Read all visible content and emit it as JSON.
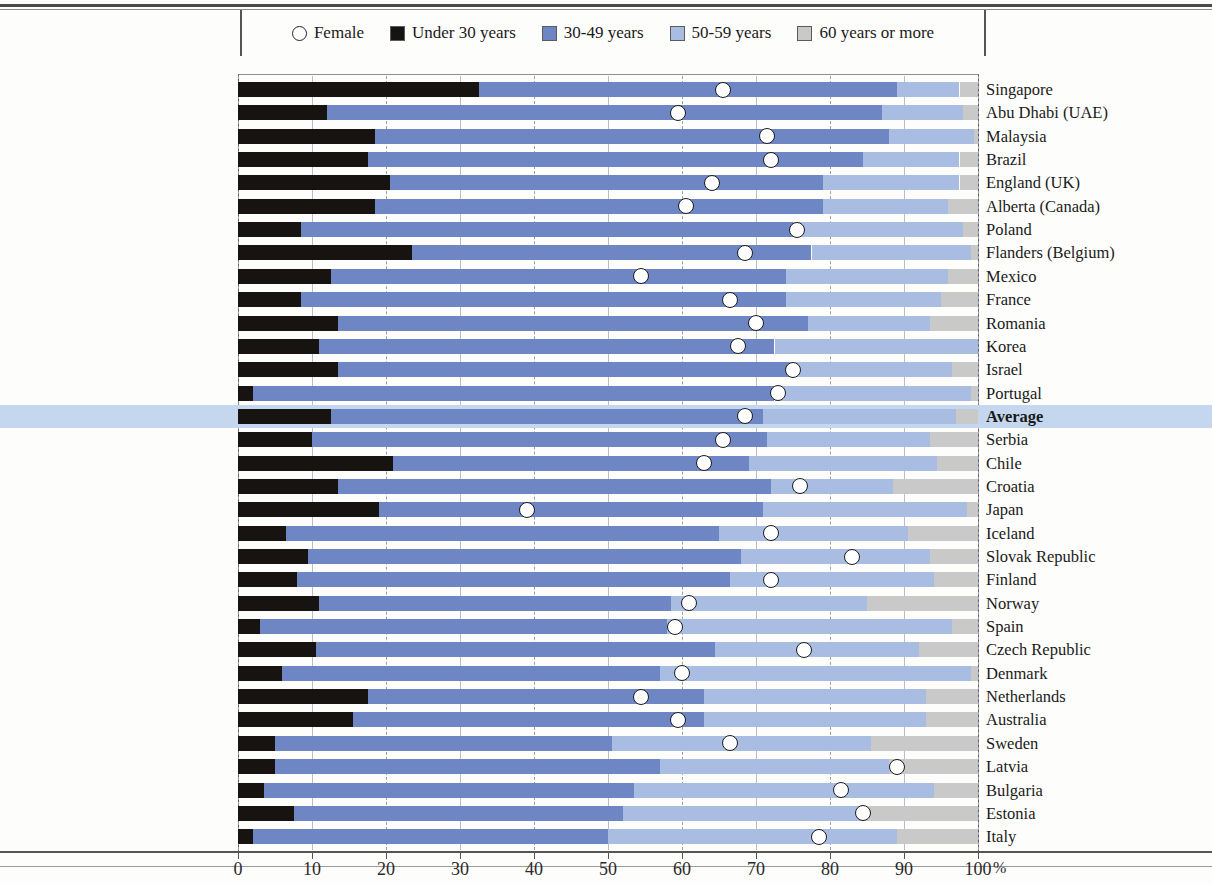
{
  "legend": {
    "items": [
      {
        "label": "Female",
        "type": "circle",
        "color": "#ffffff"
      },
      {
        "label": "Under 30 years",
        "type": "swatch",
        "color": "#171310"
      },
      {
        "label": "30-49 years",
        "type": "swatch",
        "color": "#6e87c4"
      },
      {
        "label": "50-59 years",
        "type": "swatch",
        "color": "#a9bde2"
      },
      {
        "label": "60 years or more",
        "type": "swatch",
        "color": "#c9c9c9"
      }
    ]
  },
  "axis": {
    "ticks": [
      "0",
      "10",
      "20",
      "30",
      "40",
      "50",
      "60",
      "70",
      "80",
      "90",
      "100"
    ],
    "unit": "%",
    "min": 0,
    "max": 100
  },
  "chart_data": {
    "type": "bar",
    "orientation": "horizontal",
    "stacked": true,
    "title": "",
    "xlabel": "%",
    "ylabel": "",
    "xlim": [
      0,
      100
    ],
    "grid": true,
    "legend_position": "top",
    "series": [
      {
        "name": "Under 30 years",
        "color": "#171310"
      },
      {
        "name": "30-49 years",
        "color": "#6e87c4"
      },
      {
        "name": "50-59 years",
        "color": "#a9bde2"
      },
      {
        "name": "60 years or more",
        "color": "#c9c9c9"
      }
    ],
    "marker_series": {
      "name": "Female",
      "color": "#ffffff",
      "shape": "circle"
    },
    "categories": [
      "Singapore",
      "Abu Dhabi (UAE)",
      "Malaysia",
      "Brazil",
      "England (UK)",
      "Alberta (Canada)",
      "Poland",
      "Flanders (Belgium)",
      "Mexico",
      "France",
      "Romania",
      "Korea",
      "Israel",
      "Portugal",
      "Average",
      "Serbia",
      "Chile",
      "Croatia",
      "Japan",
      "Iceland",
      "Slovak Republic",
      "Finland",
      "Norway",
      "Spain",
      "Czech Republic",
      "Denmark",
      "Netherlands",
      "Australia",
      "Sweden",
      "Latvia",
      "Bulgaria",
      "Estonia",
      "Italy"
    ],
    "rows": [
      {
        "category": "Singapore",
        "under30": 32.5,
        "a3049": 56.5,
        "a5059": 8.5,
        "a60": 2.5,
        "female": 65.5,
        "highlight": false
      },
      {
        "category": "Abu Dhabi (UAE)",
        "under30": 12.0,
        "a3049": 75.0,
        "a5059": 11.0,
        "a60": 2.0,
        "female": 59.5,
        "highlight": false
      },
      {
        "category": "Malaysia",
        "under30": 18.5,
        "a3049": 69.5,
        "a5059": 11.5,
        "a60": 0.5,
        "female": 71.5,
        "highlight": false
      },
      {
        "category": "Brazil",
        "under30": 17.5,
        "a3049": 67.0,
        "a5059": 13.0,
        "a60": 2.5,
        "female": 72.0,
        "highlight": false
      },
      {
        "category": "England (UK)",
        "under30": 20.5,
        "a3049": 58.5,
        "a5059": 18.5,
        "a60": 2.5,
        "female": 64.0,
        "highlight": false
      },
      {
        "category": "Alberta (Canada)",
        "under30": 18.5,
        "a3049": 60.5,
        "a5059": 17.0,
        "a60": 4.0,
        "female": 60.5,
        "highlight": false
      },
      {
        "category": "Poland",
        "under30": 8.5,
        "a3049": 66.5,
        "a5059": 23.0,
        "a60": 2.0,
        "female": 75.5,
        "highlight": false
      },
      {
        "category": "Flanders (Belgium)",
        "under30": 23.5,
        "a3049": 54.0,
        "a5059": 21.5,
        "a60": 1.0,
        "female": 68.5,
        "highlight": false
      },
      {
        "category": "Mexico",
        "under30": 12.5,
        "a3049": 61.5,
        "a5059": 22.0,
        "a60": 4.0,
        "female": 54.5,
        "highlight": false
      },
      {
        "category": "France",
        "under30": 8.5,
        "a3049": 65.5,
        "a5059": 21.0,
        "a60": 5.0,
        "female": 66.5,
        "highlight": false
      },
      {
        "category": "Romania",
        "under30": 13.5,
        "a3049": 63.5,
        "a5059": 16.5,
        "a60": 6.5,
        "female": 70.0,
        "highlight": false
      },
      {
        "category": "Korea",
        "under30": 11.0,
        "a3049": 61.5,
        "a5059": 27.5,
        "a60": 0.0,
        "female": 67.5,
        "highlight": false
      },
      {
        "category": "Israel",
        "under30": 13.5,
        "a3049": 61.0,
        "a5059": 22.0,
        "a60": 3.5,
        "female": 75.0,
        "highlight": false
      },
      {
        "category": "Portugal",
        "under30": 2.0,
        "a3049": 70.5,
        "a5059": 26.5,
        "a60": 1.0,
        "female": 73.0,
        "highlight": false
      },
      {
        "category": "Average",
        "under30": 12.5,
        "a3049": 58.5,
        "a5059": 26.0,
        "a60": 3.0,
        "female": 68.5,
        "highlight": true
      },
      {
        "category": "Serbia",
        "under30": 10.0,
        "a3049": 61.5,
        "a5059": 22.0,
        "a60": 6.5,
        "female": 65.5,
        "highlight": false
      },
      {
        "category": "Chile",
        "under30": 21.0,
        "a3049": 48.0,
        "a5059": 25.5,
        "a60": 5.5,
        "female": 63.0,
        "highlight": false
      },
      {
        "category": "Croatia",
        "under30": 13.5,
        "a3049": 58.5,
        "a5059": 16.5,
        "a60": 11.5,
        "female": 76.0,
        "highlight": false
      },
      {
        "category": "Japan",
        "under30": 19.0,
        "a3049": 52.0,
        "a5059": 27.5,
        "a60": 1.5,
        "female": 39.0,
        "highlight": false
      },
      {
        "category": "Iceland",
        "under30": 6.5,
        "a3049": 58.5,
        "a5059": 25.5,
        "a60": 9.5,
        "female": 72.0,
        "highlight": false
      },
      {
        "category": "Slovak Republic",
        "under30": 9.5,
        "a3049": 58.5,
        "a5059": 25.5,
        "a60": 6.5,
        "female": 83.0,
        "highlight": false
      },
      {
        "category": "Finland",
        "under30": 8.0,
        "a3049": 58.5,
        "a5059": 27.5,
        "a60": 6.0,
        "female": 72.0,
        "highlight": false
      },
      {
        "category": "Norway",
        "under30": 11.0,
        "a3049": 47.5,
        "a5059": 26.5,
        "a60": 15.0,
        "female": 61.0,
        "highlight": false
      },
      {
        "category": "Spain",
        "under30": 3.0,
        "a3049": 55.0,
        "a5059": 38.5,
        "a60": 3.5,
        "female": 59.0,
        "highlight": false
      },
      {
        "category": "Czech Republic",
        "under30": 10.5,
        "a3049": 54.0,
        "a5059": 27.5,
        "a60": 8.0,
        "female": 76.5,
        "highlight": false
      },
      {
        "category": "Denmark",
        "under30": 6.0,
        "a3049": 51.0,
        "a5059": 42.0,
        "a60": 1.0,
        "female": 60.0,
        "highlight": false
      },
      {
        "category": "Netherlands",
        "under30": 17.5,
        "a3049": 45.5,
        "a5059": 30.0,
        "a60": 7.0,
        "female": 54.5,
        "highlight": false
      },
      {
        "category": "Australia",
        "under30": 15.5,
        "a3049": 47.5,
        "a5059": 30.0,
        "a60": 7.0,
        "female": 59.5,
        "highlight": false
      },
      {
        "category": "Sweden",
        "under30": 5.0,
        "a3049": 45.5,
        "a5059": 35.0,
        "a60": 14.5,
        "female": 66.5,
        "highlight": false
      },
      {
        "category": "Latvia",
        "under30": 5.0,
        "a3049": 52.0,
        "a5059": 31.0,
        "a60": 12.0,
        "female": 89.0,
        "highlight": false
      },
      {
        "category": "Bulgaria",
        "under30": 3.5,
        "a3049": 50.0,
        "a5059": 40.5,
        "a60": 6.0,
        "female": 81.5,
        "highlight": false
      },
      {
        "category": "Estonia",
        "under30": 7.5,
        "a3049": 44.5,
        "a5059": 32.5,
        "a60": 15.5,
        "female": 84.5,
        "highlight": false
      },
      {
        "category": "Italy",
        "under30": 2.0,
        "a3049": 48.0,
        "a5059": 39.0,
        "a60": 11.0,
        "female": 78.5,
        "highlight": false
      }
    ]
  }
}
